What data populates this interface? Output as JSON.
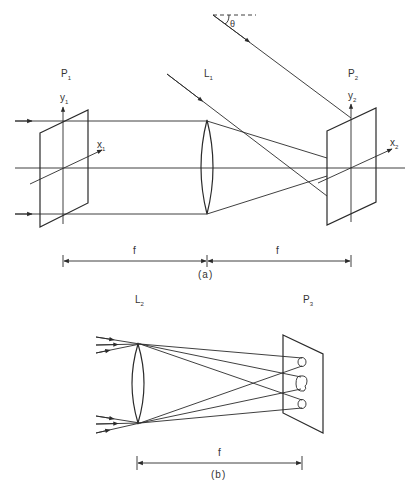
{
  "figure_a": {
    "caption": "(a)",
    "plane_in": {
      "label": "P",
      "sub": "1",
      "y_axis": "y",
      "y_sub": "1",
      "x_axis": "x",
      "x_sub": "1"
    },
    "lens": {
      "label": "L",
      "sub": "1"
    },
    "plane_out": {
      "label": "P",
      "sub": "2",
      "y_axis": "y",
      "y_sub": "2",
      "x_axis": "x",
      "x_sub": "2"
    },
    "angle_label": "θ",
    "dim_left": "f",
    "dim_right": "f"
  },
  "figure_b": {
    "caption": "(b)",
    "lens": {
      "label": "L",
      "sub": "2"
    },
    "plane": {
      "label": "P",
      "sub": "3"
    },
    "dim": "f"
  }
}
